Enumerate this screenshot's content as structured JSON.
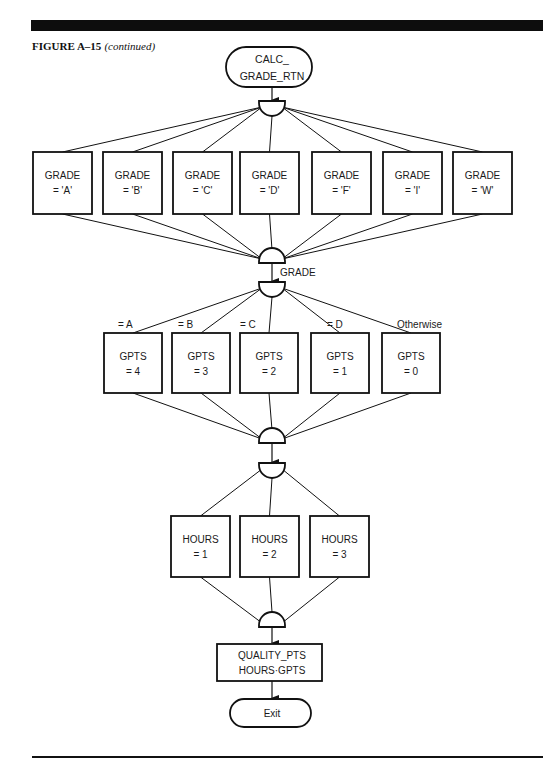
{
  "header": {
    "figure_label": "FIGURE A–15",
    "figure_note": "(continued)"
  },
  "diagram": {
    "start": {
      "line1": "CALC_",
      "line2": "GRADE_RTN"
    },
    "grade_checks": [
      {
        "line1": "GRADE",
        "line2": "= 'A'"
      },
      {
        "line1": "GRADE",
        "line2": "= 'B'"
      },
      {
        "line1": "GRADE",
        "line2": "= 'C'"
      },
      {
        "line1": "GRADE",
        "line2": "= 'D'"
      },
      {
        "line1": "GRADE",
        "line2": "= 'F'"
      },
      {
        "line1": "GRADE",
        "line2": "= 'I'"
      },
      {
        "line1": "GRADE",
        "line2": "= 'W'"
      }
    ],
    "case_selector_label": "GRADE",
    "gpts_cases": [
      {
        "condition": "= A",
        "line1": "GPTS",
        "line2": "= 4"
      },
      {
        "condition": "= B",
        "line1": "GPTS",
        "line2": "= 3"
      },
      {
        "condition": "= C",
        "line1": "GPTS",
        "line2": "= 2"
      },
      {
        "condition": "= D",
        "line1": "GPTS",
        "line2": "= 1"
      },
      {
        "condition": "Otherwise",
        "line1": "GPTS",
        "line2": "= 0"
      }
    ],
    "hours_cases": [
      {
        "line1": "HOURS",
        "line2": "= 1"
      },
      {
        "line1": "HOURS",
        "line2": "= 2"
      },
      {
        "line1": "HOURS",
        "line2": "= 3"
      }
    ],
    "compute": {
      "line1": "QUALITY_PTS",
      "line2": "HOURS·GPTS"
    },
    "end": {
      "label": "Exit"
    }
  }
}
